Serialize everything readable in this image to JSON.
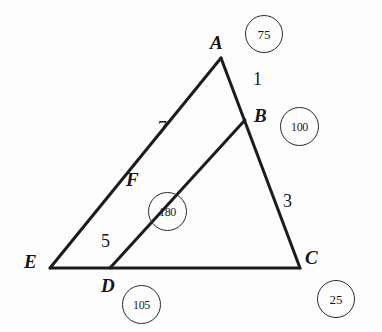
{
  "figure": {
    "type": "geometry-diagram",
    "background_color": "#fdfdfd",
    "stroke_color": "#1c1c1c",
    "width": 382,
    "height": 332
  },
  "vertices": [
    {
      "id": "A",
      "label": "A",
      "x": 221,
      "y": 58,
      "label_x": 210,
      "label_y": 33
    },
    {
      "id": "B",
      "label": "B",
      "x": 245,
      "y": 120,
      "label_x": 254,
      "label_y": 106
    },
    {
      "id": "C",
      "label": "C",
      "x": 300,
      "y": 268,
      "label_x": 305,
      "label_y": 248
    },
    {
      "id": "D",
      "label": "D",
      "x": 110,
      "y": 268,
      "label_x": 101,
      "label_y": 276
    },
    {
      "id": "E",
      "label": "E",
      "x": 50,
      "y": 268,
      "label_x": 24,
      "label_y": 252
    },
    {
      "id": "F",
      "label": "F",
      "x": 148,
      "y": 190,
      "label_x": 126,
      "label_y": 170
    }
  ],
  "segments": [
    {
      "name": "side-A-C",
      "from": "A",
      "to": "C"
    },
    {
      "name": "side-E-C",
      "from": "E",
      "to": "C"
    },
    {
      "name": "line-E-A",
      "from": "E",
      "to": "A"
    },
    {
      "name": "line-D-B",
      "from": "D",
      "to": "B"
    }
  ],
  "edge_labels": [
    {
      "id": "edge-1",
      "text": "1",
      "x": 253,
      "y": 70,
      "for_segment": "side-A-C"
    },
    {
      "id": "edge-3",
      "text": "3",
      "x": 283,
      "y": 192,
      "for_segment": "side-A-C"
    },
    {
      "id": "edge-7",
      "text": "7",
      "x": 158,
      "y": 119,
      "for_segment": "line-E-A"
    },
    {
      "id": "edge-5",
      "text": "5",
      "x": 101,
      "y": 232,
      "for_segment": "line-D-B"
    }
  ],
  "badges": [
    {
      "id": "badge-A",
      "value": "75",
      "x": 245,
      "y": 15,
      "size": 38,
      "for_vertex": "A"
    },
    {
      "id": "badge-B",
      "value": "100",
      "x": 280,
      "y": 107,
      "size": 39,
      "for_vertex": "B"
    },
    {
      "id": "badge-F",
      "value": "180",
      "x": 148,
      "y": 192,
      "size": 39,
      "for_vertex": "F"
    },
    {
      "id": "badge-D",
      "value": "105",
      "x": 122,
      "y": 285,
      "size": 39,
      "for_vertex": "D"
    },
    {
      "id": "badge-C",
      "value": "25",
      "x": 317,
      "y": 280,
      "size": 38,
      "for_vertex": "C"
    }
  ]
}
